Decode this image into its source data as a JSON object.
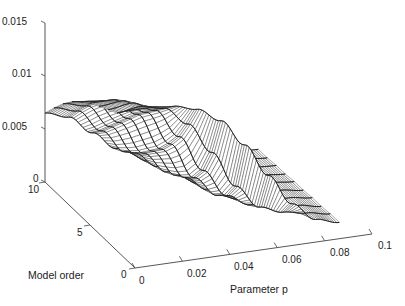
{
  "chart_data": {
    "type": "surface",
    "style": "3d-mesh",
    "title": "",
    "xlabel": "Parameter p",
    "ylabel": "Model order",
    "zlabel": "",
    "x_ticks": [
      "0",
      "0.02",
      "0.04",
      "0.06",
      "0.08",
      "0.1"
    ],
    "y_ticks": [
      "0",
      "5",
      "10"
    ],
    "z_ticks": [
      "0",
      "0.005",
      "0.01",
      "0.015"
    ],
    "xlim": [
      0,
      0.1
    ],
    "ylim": [
      0,
      10
    ],
    "zlim": [
      0,
      0.015
    ],
    "grid": false,
    "legend": null,
    "x": [
      0,
      0.01,
      0.02,
      0.03,
      0.04,
      0.05,
      0.06,
      0.07,
      0.08,
      0.09
    ],
    "y": [
      1,
      2,
      3,
      4,
      5,
      6,
      7,
      8,
      9,
      10
    ],
    "series": [
      {
        "name": "order 1",
        "values": [
          0.014,
          0.014,
          0.0138,
          0.0132,
          0.0118,
          0.0092,
          0.006,
          0.003,
          0.0012,
          0.0006
        ]
      },
      {
        "name": "order 2",
        "values": [
          0.013,
          0.0133,
          0.0128,
          0.011,
          0.008,
          0.0045,
          0.0022,
          0.0014,
          0.001,
          0.0006
        ]
      },
      {
        "name": "order 3",
        "values": [
          0.0125,
          0.0128,
          0.0118,
          0.009,
          0.0055,
          0.0028,
          0.0016,
          0.0012,
          0.0009,
          0.0005
        ]
      },
      {
        "name": "order 4",
        "values": [
          0.012,
          0.0122,
          0.0108,
          0.0075,
          0.004,
          0.002,
          0.0013,
          0.001,
          0.0008,
          0.0005
        ]
      },
      {
        "name": "order 5",
        "values": [
          0.0115,
          0.0115,
          0.0098,
          0.0062,
          0.0032,
          0.0017,
          0.0012,
          0.0009,
          0.0007,
          0.0004
        ]
      },
      {
        "name": "order 6",
        "values": [
          0.0108,
          0.0106,
          0.0086,
          0.0052,
          0.0026,
          0.0015,
          0.0011,
          0.0008,
          0.0006,
          0.0004
        ]
      },
      {
        "name": "order 7",
        "values": [
          0.01,
          0.0096,
          0.0074,
          0.0042,
          0.0021,
          0.0013,
          0.001,
          0.0007,
          0.0005,
          0.0003
        ]
      },
      {
        "name": "order 8",
        "values": [
          0.009,
          0.0085,
          0.0062,
          0.0034,
          0.0018,
          0.0011,
          0.0009,
          0.0006,
          0.0004,
          0.0003
        ]
      },
      {
        "name": "order 9",
        "values": [
          0.0078,
          0.0072,
          0.005,
          0.0027,
          0.0015,
          0.001,
          0.0008,
          0.0005,
          0.0004,
          0.0002
        ]
      },
      {
        "name": "order 10",
        "values": [
          0.0065,
          0.0058,
          0.004,
          0.0022,
          0.0013,
          0.0009,
          0.0007,
          0.0005,
          0.0003,
          0.0002
        ]
      }
    ]
  },
  "labels": {
    "x_axis_title": "Parameter p",
    "y_axis_title": "Model order"
  }
}
